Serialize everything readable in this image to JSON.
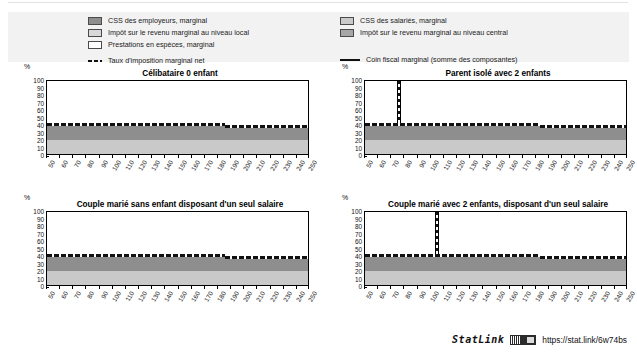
{
  "legend": {
    "left_items": [
      {
        "label": "CSS des employeurs, marginal",
        "swatch": "employer-ssc-swatch",
        "color": "#8e8e8e",
        "type": "area"
      },
      {
        "label": "Impôt sur le revenu marginal au niveau local",
        "swatch": "local-income-tax-swatch",
        "color": "#d8d8d8",
        "type": "area"
      },
      {
        "label": "Prestations en espèces, marginal",
        "swatch": "cash-benefits-swatch",
        "color": "#ffffff",
        "type": "area"
      },
      {
        "label": "Taux d'imposition marginal net",
        "swatch": "net-tax-rate-dashed-line",
        "color": "#111111",
        "type": "dashed-line"
      }
    ],
    "right_items": [
      {
        "label": "CSS des salariés, marginal",
        "swatch": "employee-ssc-swatch",
        "color": "#c9c9c9",
        "type": "area"
      },
      {
        "label": "Impôt sur le revenu marginal au niveau central",
        "swatch": "central-income-tax-swatch",
        "color": "#a6a6a6",
        "type": "area"
      },
      {
        "label": "Coin fiscal marginal (somme des composantes)",
        "swatch": "marginal-tax-wedge-solid-line",
        "color": "#111111",
        "type": "solid-line"
      }
    ]
  },
  "axis": {
    "y_unit": "%",
    "y_ticks": [
      100,
      90,
      80,
      70,
      60,
      50,
      40,
      30,
      20,
      10,
      0
    ],
    "x_ticks": [
      50,
      60,
      70,
      80,
      90,
      100,
      110,
      120,
      130,
      140,
      150,
      160,
      170,
      180,
      190,
      200,
      210,
      220,
      230,
      240,
      250
    ]
  },
  "chart_data": {
    "type": "area",
    "title": "",
    "xlabel": "",
    "ylabel": "%",
    "xlim": [
      50,
      250
    ],
    "ylim": [
      0,
      100
    ],
    "grid": false,
    "legend_position": "top",
    "panels": [
      {
        "id": "panel-celibataire-0-enfant",
        "title": "Célibataire 0 enfant",
        "series": [
          {
            "name": "CSS des salariés, marginal",
            "color": "#c9c9c9",
            "band": [
              0,
              21
            ],
            "values_note": "constante ≈ 21 % de 50 à 250"
          },
          {
            "name": "CSS des employeurs, marginal",
            "color": "#8e8e8e",
            "band": [
              21,
              43
            ],
            "values_note": "≈ 43 % jusqu'à 185, puis ≈ 41 %"
          },
          {
            "name": "Impôt sur le revenu marginal au niveau central",
            "color": "#a6a6a6",
            "band": [
              0,
              0
            ],
            "values_note": "nul"
          },
          {
            "name": "Impôt sur le revenu marginal au niveau local",
            "color": "#d8d8d8",
            "band": [
              0,
              0
            ],
            "values_note": "nul"
          },
          {
            "name": "Prestations en espèces, marginal",
            "color": "#ffffff",
            "band": [
              0,
              0
            ],
            "values_note": "nul"
          }
        ],
        "lines": [
          {
            "name": "Coin fiscal marginal (somme des composantes)",
            "style": "solid",
            "color": "#111111",
            "levels": [
              {
                "x_from": 50,
                "x_to": 185,
                "y": 43.5
              },
              {
                "x_from": 185,
                "x_to": 250,
                "y": 41
              }
            ]
          },
          {
            "name": "Taux d'imposition marginal net",
            "style": "dashed",
            "color": "#111111",
            "levels": [
              {
                "x_from": 50,
                "x_to": 185,
                "y": 43
              },
              {
                "x_from": 185,
                "x_to": 250,
                "y": 40.5
              }
            ]
          }
        ],
        "spike": null
      },
      {
        "id": "panel-parent-isole-2-enfants",
        "title": "Parent isolé avec 2 enfants",
        "series": [
          {
            "name": "CSS des salariés, marginal",
            "color": "#c9c9c9",
            "band": [
              0,
              21
            ],
            "values_note": "constante ≈ 21 %"
          },
          {
            "name": "CSS des employeurs, marginal",
            "color": "#8e8e8e",
            "band": [
              21,
              43
            ],
            "values_note": "≈ 43 % jusqu'à 183, puis ≈ 41 %"
          }
        ],
        "lines": [
          {
            "name": "Coin fiscal marginal (somme des composantes)",
            "style": "solid",
            "color": "#111111",
            "levels": [
              {
                "x_from": 50,
                "x_to": 183,
                "y": 43.5
              },
              {
                "x_from": 183,
                "x_to": 250,
                "y": 41
              }
            ]
          },
          {
            "name": "Taux d'imposition marginal net",
            "style": "dashed",
            "color": "#111111",
            "levels": [
              {
                "x_from": 50,
                "x_to": 183,
                "y": 43
              },
              {
                "x_from": 183,
                "x_to": 250,
                "y": 40.5
              }
            ]
          }
        ],
        "spike": {
          "x": 76,
          "y_top": 100,
          "label": "pic à 100 % vers 76 % du salaire moyen"
        }
      },
      {
        "id": "panel-couple-sans-enfant-un-salaire",
        "title": "Couple marié sans enfant disposant d'un seul salaire",
        "series": [
          {
            "name": "CSS des salariés, marginal",
            "color": "#c9c9c9",
            "band": [
              0,
              21
            ],
            "values_note": "constante ≈ 21 %"
          },
          {
            "name": "CSS des employeurs, marginal",
            "color": "#8e8e8e",
            "band": [
              21,
              43
            ],
            "values_note": "≈ 43 % jusqu'à 185, puis ≈ 41 %"
          }
        ],
        "lines": [
          {
            "name": "Coin fiscal marginal (somme des composantes)",
            "style": "solid",
            "color": "#111111",
            "levels": [
              {
                "x_from": 50,
                "x_to": 185,
                "y": 43.5
              },
              {
                "x_from": 185,
                "x_to": 250,
                "y": 41
              }
            ]
          },
          {
            "name": "Taux d'imposition marginal net",
            "style": "dashed",
            "color": "#111111",
            "levels": [
              {
                "x_from": 50,
                "x_to": 185,
                "y": 43
              },
              {
                "x_from": 185,
                "x_to": 250,
                "y": 40.5
              }
            ]
          }
        ],
        "spike": null
      },
      {
        "id": "panel-couple-2-enfants-un-salaire",
        "title": "Couple marié avec 2 enfants, disposant d'un seul salaire",
        "series": [
          {
            "name": "CSS des salariés, marginal",
            "color": "#c9c9c9",
            "band": [
              0,
              21
            ],
            "values_note": "constante ≈ 21 %"
          },
          {
            "name": "CSS des employeurs, marginal",
            "color": "#8e8e8e",
            "band": [
              21,
              43
            ],
            "values_note": "≈ 43 % jusqu'à 183, puis ≈ 41 %"
          }
        ],
        "lines": [
          {
            "name": "Coin fiscal marginal (somme des composantes)",
            "style": "solid",
            "color": "#111111",
            "levels": [
              {
                "x_from": 50,
                "x_to": 183,
                "y": 43.5
              },
              {
                "x_from": 183,
                "x_to": 250,
                "y": 41
              }
            ]
          },
          {
            "name": "Taux d'imposition marginal net",
            "style": "dashed",
            "color": "#111111",
            "levels": [
              {
                "x_from": 50,
                "x_to": 183,
                "y": 43
              },
              {
                "x_from": 183,
                "x_to": 250,
                "y": 40.5
              }
            ]
          }
        ],
        "spike": {
          "x": 105,
          "y_top": 100,
          "label": "pic à 100 % vers 105 % du salaire moyen"
        }
      }
    ]
  },
  "footer": {
    "statlink_word": "StatLink",
    "statlink_url": "https://stat.link/6w74bs"
  }
}
